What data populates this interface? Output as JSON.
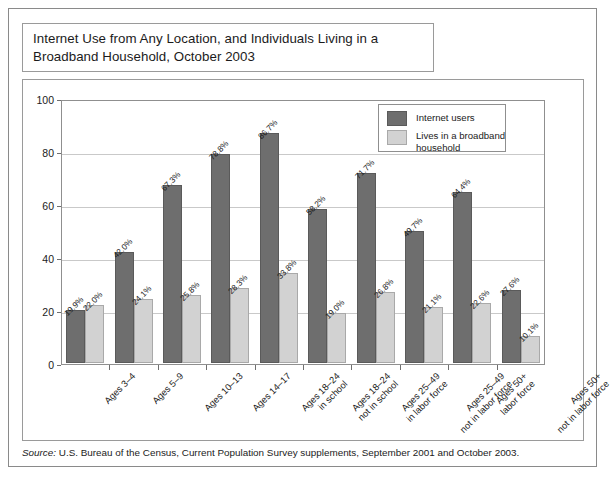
{
  "title": "Internet Use from Any Location, and Individuals Living in a Broadband Household, October 2003",
  "source": {
    "label": "Source:",
    "text": " U.S. Bureau of the Census, Current Population Survey supplements, September 2001 and October 2003."
  },
  "legend": {
    "items": [
      {
        "label": "Internet users",
        "color": "#6e6e6e"
      },
      {
        "label": "Lives in a broadband household",
        "color": "#d2d2d2"
      }
    ]
  },
  "chart_data": {
    "type": "bar",
    "title": "Internet Use from Any Location, and Individuals Living in a Broadband Household, October 2003",
    "xlabel": "",
    "ylabel": "",
    "ylim": [
      0,
      100
    ],
    "yticks": [
      0,
      20,
      40,
      60,
      80,
      100
    ],
    "ytick_labels": [
      "0",
      "20",
      "40",
      "60",
      "80",
      "100"
    ],
    "grid": true,
    "legend_position": "top-right",
    "categories": [
      "Ages 3–4",
      "Ages 5–9",
      "Ages 10–13",
      "Ages 14–17",
      "Ages 18–24 in school",
      "Ages 18–24 not in school",
      "Ages 25–49 in labor force",
      "Ages 25–49 not in labor force",
      "Ages 50+ labor force",
      "Ages 50+ not in labor force"
    ],
    "category_lines": [
      [
        "Ages 3–4"
      ],
      [
        "Ages 5–9"
      ],
      [
        "Ages 10–13"
      ],
      [
        "Ages 14–17"
      ],
      [
        "Ages 18–24",
        "in school"
      ],
      [
        "Ages 18–24",
        "not in school"
      ],
      [
        "Ages 25–49",
        "in labor force"
      ],
      [
        "Ages 25–49",
        "not in labor force"
      ],
      [
        "Ages 50+",
        "labor force"
      ],
      [
        "Ages 50+",
        "not in labor force"
      ]
    ],
    "series": [
      {
        "name": "Internet users",
        "color": "#6e6e6e",
        "values": [
          19.9,
          42.0,
          67.3,
          78.8,
          86.7,
          58.2,
          71.7,
          49.7,
          64.4,
          27.6
        ],
        "labels": [
          "19.9%",
          "42.0%",
          "67.3%",
          "78.8%",
          "86.7%",
          "58.2%",
          "71.7%",
          "49.7%",
          "64.4%",
          "27.6%"
        ]
      },
      {
        "name": "Lives in a broadband household",
        "color": "#d2d2d2",
        "values": [
          22.0,
          24.1,
          25.8,
          28.3,
          33.8,
          19.0,
          26.8,
          21.1,
          22.6,
          10.1
        ],
        "labels": [
          "22.0%",
          "24.1%",
          "25.8%",
          "28.3%",
          "33.8%",
          "19.0%",
          "26.8%",
          "21.1%",
          "22.6%",
          "10.1%"
        ]
      }
    ]
  }
}
